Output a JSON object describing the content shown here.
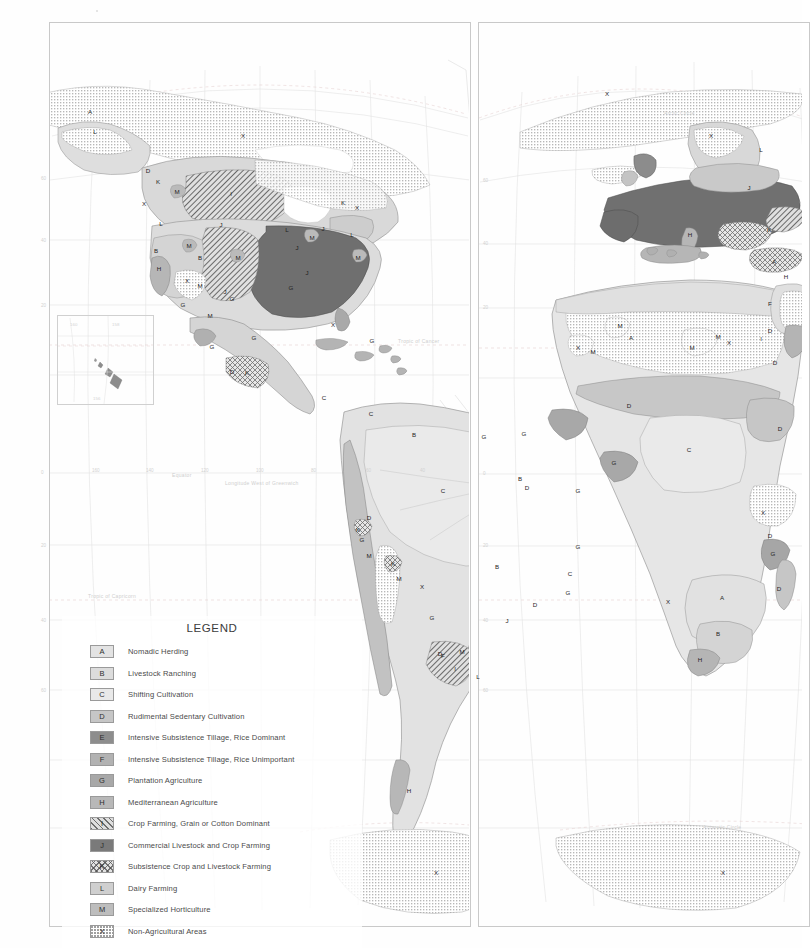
{
  "document": {
    "title": "World Agricultural Regions",
    "projection_note": "Interrupted homolosine world map, two lobes"
  },
  "legend": {
    "title": "LEGEND",
    "items": [
      {
        "key": "A",
        "label": "Nomadic Herding",
        "fill": "f-A",
        "color": "#e3e3e3"
      },
      {
        "key": "B",
        "label": "Livestock Ranching",
        "fill": "f-B",
        "color": "#dcdcdc"
      },
      {
        "key": "C",
        "label": "Shifting Cultivation",
        "fill": "f-C",
        "color": "#e9e9e9"
      },
      {
        "key": "D",
        "label": "Rudimental Sedentary Cultivation",
        "fill": "f-D",
        "color": "#c6c6c6"
      },
      {
        "key": "E",
        "label": "Intensive Subsistence Tillage, Rice Dominant",
        "fill": "f-E",
        "color": "#8d8d8d"
      },
      {
        "key": "F",
        "label": "Intensive Subsistence Tillage, Rice Unimportant",
        "fill": "f-F",
        "color": "#b2b2b2"
      },
      {
        "key": "G",
        "label": "Plantation Agriculture",
        "fill": "f-G",
        "color": "#a8a8a8"
      },
      {
        "key": "H",
        "label": "Mediterranean Agriculture",
        "fill": "f-H",
        "color": "#b8b8b8"
      },
      {
        "key": "I",
        "label": "Crop Farming, Grain or Cotton Dominant",
        "fill": "f-I",
        "color": "#dedede"
      },
      {
        "key": "J",
        "label": "Commercial Livestock and Crop Farming",
        "fill": "f-J",
        "color": "#7a7a7a"
      },
      {
        "key": "K",
        "label": "Subsistence Crop and Livestock Farming",
        "fill": "f-K",
        "color": "#e2e2e2"
      },
      {
        "key": "L",
        "label": "Dairy Farming",
        "fill": "f-L",
        "color": "#cfcfcf"
      },
      {
        "key": "M",
        "label": "Specialized Horticulture",
        "fill": "f-M",
        "color": "#bdbdbd"
      },
      {
        "key": "X",
        "label": "Non-Agricultural Areas",
        "fill": "f-X",
        "color": "#ffffff"
      }
    ]
  },
  "map_labels": {
    "equator": "Equator",
    "longitude_note": "Longitude West of Greenwich",
    "tropic_capricorn": "Tropic of Capricorn",
    "tropic_cancer": "Tropic of Cancer",
    "arctic_circle": "Arctic Circle",
    "antarctic_circle": "Antarctic Circle"
  },
  "graticule_ticks": {
    "west_panel_longitudes": [
      "160",
      "140",
      "120",
      "100",
      "80",
      "60",
      "40"
    ],
    "west_panel_latitudes": [
      "60",
      "40",
      "20",
      "0",
      "20",
      "40",
      "60"
    ],
    "east_panel_latitudes": [
      "60",
      "40",
      "20",
      "0",
      "20",
      "40",
      "60"
    ]
  },
  "inset": {
    "name": "Hawaii",
    "ticks": [
      "160",
      "158",
      "156"
    ]
  },
  "region_annotations": {
    "west_panel": [
      {
        "key": "A",
        "x": 90,
        "y": 111
      },
      {
        "key": "L",
        "x": 95,
        "y": 131
      },
      {
        "key": "D",
        "x": 148,
        "y": 170
      },
      {
        "key": "K",
        "x": 158,
        "y": 181
      },
      {
        "key": "X",
        "x": 144,
        "y": 203
      },
      {
        "key": "M",
        "x": 177,
        "y": 191
      },
      {
        "key": "I",
        "x": 231,
        "y": 193
      },
      {
        "key": "X",
        "x": 243,
        "y": 135
      },
      {
        "key": "K",
        "x": 343,
        "y": 202
      },
      {
        "key": "X",
        "x": 357,
        "y": 207
      },
      {
        "key": "J",
        "x": 221,
        "y": 224
      },
      {
        "key": "L",
        "x": 287,
        "y": 229
      },
      {
        "key": "M",
        "x": 312,
        "y": 237
      },
      {
        "key": "J",
        "x": 323,
        "y": 228
      },
      {
        "key": "L",
        "x": 352,
        "y": 234
      },
      {
        "key": "M",
        "x": 358,
        "y": 257
      },
      {
        "key": "L",
        "x": 161,
        "y": 223
      },
      {
        "key": "B",
        "x": 156,
        "y": 250
      },
      {
        "key": "M",
        "x": 189,
        "y": 245
      },
      {
        "key": "B",
        "x": 200,
        "y": 257
      },
      {
        "key": "M",
        "x": 238,
        "y": 257
      },
      {
        "key": "H",
        "x": 159,
        "y": 268
      },
      {
        "key": "J",
        "x": 297,
        "y": 247
      },
      {
        "key": "J",
        "x": 307,
        "y": 272
      },
      {
        "key": "G",
        "x": 291,
        "y": 287
      },
      {
        "key": "X",
        "x": 187,
        "y": 280
      },
      {
        "key": "M",
        "x": 200,
        "y": 285
      },
      {
        "key": "G",
        "x": 183,
        "y": 304
      },
      {
        "key": "J",
        "x": 225,
        "y": 291
      },
      {
        "key": "G",
        "x": 232,
        "y": 298
      },
      {
        "key": "M",
        "x": 210,
        "y": 315
      },
      {
        "key": "X",
        "x": 333,
        "y": 324
      },
      {
        "key": "G",
        "x": 212,
        "y": 346
      },
      {
        "key": "G",
        "x": 254,
        "y": 337
      },
      {
        "key": "G",
        "x": 372,
        "y": 340
      },
      {
        "key": "D",
        "x": 232,
        "y": 371
      },
      {
        "key": "K",
        "x": 247,
        "y": 372
      },
      {
        "key": "C",
        "x": 324,
        "y": 397
      },
      {
        "key": "C",
        "x": 371,
        "y": 413
      },
      {
        "key": "B",
        "x": 414,
        "y": 434
      },
      {
        "key": "G",
        "x": 484,
        "y": 436
      },
      {
        "key": "C",
        "x": 443,
        "y": 490
      },
      {
        "key": "B",
        "x": 520,
        "y": 478
      },
      {
        "key": "D",
        "x": 527,
        "y": 487
      },
      {
        "key": "G",
        "x": 578,
        "y": 490
      },
      {
        "key": "D",
        "x": 369,
        "y": 517
      },
      {
        "key": "K",
        "x": 358,
        "y": 529
      },
      {
        "key": "G",
        "x": 362,
        "y": 539
      },
      {
        "key": "M",
        "x": 369,
        "y": 555
      },
      {
        "key": "K",
        "x": 393,
        "y": 563
      },
      {
        "key": "M",
        "x": 399,
        "y": 578
      },
      {
        "key": "X",
        "x": 422,
        "y": 586
      },
      {
        "key": "B",
        "x": 497,
        "y": 566
      },
      {
        "key": "C",
        "x": 570,
        "y": 573
      },
      {
        "key": "G",
        "x": 578,
        "y": 546
      },
      {
        "key": "G",
        "x": 568,
        "y": 592
      },
      {
        "key": "D",
        "x": 535,
        "y": 604
      },
      {
        "key": "J",
        "x": 507,
        "y": 620
      },
      {
        "key": "G",
        "x": 432,
        "y": 617
      },
      {
        "key": "D",
        "x": 440,
        "y": 653
      },
      {
        "key": "F",
        "x": 443,
        "y": 655
      },
      {
        "key": "M",
        "x": 462,
        "y": 651
      },
      {
        "key": "I",
        "x": 455,
        "y": 668
      },
      {
        "key": "L",
        "x": 478,
        "y": 676
      },
      {
        "key": "H",
        "x": 409,
        "y": 790
      },
      {
        "key": "X",
        "x": 436,
        "y": 872
      }
    ],
    "east_panel": [
      {
        "key": "X",
        "x": 607,
        "y": 93
      },
      {
        "key": "X",
        "x": 711,
        "y": 135
      },
      {
        "key": "L",
        "x": 761,
        "y": 149
      },
      {
        "key": "J",
        "x": 749,
        "y": 187
      },
      {
        "key": "K",
        "x": 769,
        "y": 229
      },
      {
        "key": "A",
        "x": 774,
        "y": 261
      },
      {
        "key": "H",
        "x": 690,
        "y": 234
      },
      {
        "key": "H",
        "x": 786,
        "y": 276
      },
      {
        "key": "M",
        "x": 620,
        "y": 325
      },
      {
        "key": "A",
        "x": 631,
        "y": 337
      },
      {
        "key": "X",
        "x": 578,
        "y": 347
      },
      {
        "key": "M",
        "x": 593,
        "y": 351
      },
      {
        "key": "M",
        "x": 692,
        "y": 347
      },
      {
        "key": "X",
        "x": 729,
        "y": 342
      },
      {
        "key": "M",
        "x": 718,
        "y": 336
      },
      {
        "key": "D",
        "x": 770,
        "y": 330
      },
      {
        "key": "D",
        "x": 775,
        "y": 362
      },
      {
        "key": "I",
        "x": 761,
        "y": 338
      },
      {
        "key": "F",
        "x": 770,
        "y": 303
      },
      {
        "key": "D",
        "x": 629,
        "y": 405
      },
      {
        "key": "G",
        "x": 524,
        "y": 433
      },
      {
        "key": "G",
        "x": 614,
        "y": 462
      },
      {
        "key": "C",
        "x": 689,
        "y": 449
      },
      {
        "key": "D",
        "x": 780,
        "y": 428
      },
      {
        "key": "X",
        "x": 763,
        "y": 512
      },
      {
        "key": "D",
        "x": 770,
        "y": 535
      },
      {
        "key": "G",
        "x": 773,
        "y": 553
      },
      {
        "key": "X",
        "x": 668,
        "y": 601
      },
      {
        "key": "A",
        "x": 722,
        "y": 597
      },
      {
        "key": "D",
        "x": 779,
        "y": 588
      },
      {
        "key": "B",
        "x": 718,
        "y": 633
      },
      {
        "key": "H",
        "x": 700,
        "y": 659
      },
      {
        "key": "X",
        "x": 723,
        "y": 872
      }
    ]
  }
}
